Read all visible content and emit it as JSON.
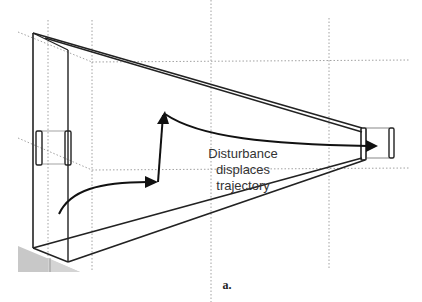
{
  "diagram": {
    "annotation_lines": [
      "Disturbance",
      "displaces",
      "trajectory"
    ],
    "caption": "a.",
    "colors": {
      "stroke": "#222222",
      "dotted": "#888888",
      "shade": "#c8c8c8",
      "text": "#333333"
    },
    "elements": [
      "left-opening-ring",
      "right-opening-ring",
      "tapered-funnel-frame",
      "trajectory-arrow",
      "ground-shading"
    ]
  }
}
